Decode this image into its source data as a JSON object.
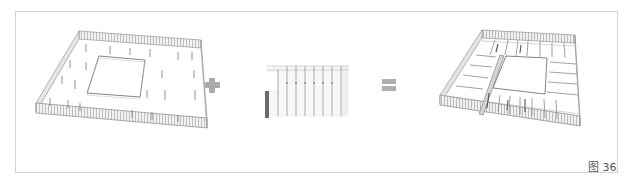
{
  "figure": {
    "caption": "图 36",
    "panels": [
      {
        "name": "perimeter-shell-model",
        "description": "Isometric wireframe of square ring building shell with columns"
      },
      {
        "name": "partition-module",
        "description": "Repeating partition wall module with dark end bar"
      },
      {
        "name": "assembled-floor-model",
        "description": "Isometric wireframe of ring building with inserted partitions"
      }
    ],
    "operators": {
      "plus": "+",
      "equals": "="
    },
    "colors": {
      "border": "#d4d4d4",
      "line": "#8a8a8a",
      "operator": "#a9a9a9",
      "caption": "#555555",
      "dark_bar": "#6a6a6a"
    }
  }
}
